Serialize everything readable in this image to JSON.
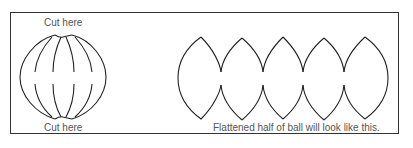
{
  "diagram": {
    "labels": {
      "cut_top": "Cut here",
      "cut_bottom": "Cut here",
      "caption": "Flattened half of ball will look like this."
    },
    "ball": {
      "segments": 6,
      "center": [
        60,
        77
      ]
    },
    "flattened": {
      "petals": 5,
      "colors": {
        "stroke": "#222222",
        "frame": "#333333"
      }
    }
  }
}
